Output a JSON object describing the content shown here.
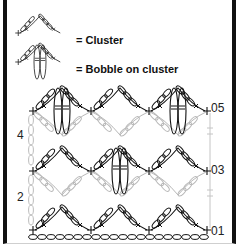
{
  "legend": {
    "cluster_label": "= Cluster",
    "bobble_label": "= Bobble on cluster"
  },
  "chart": {
    "type": "crochet-chart",
    "row_labels_left": [
      "4",
      "2"
    ],
    "row_labels_right": [
      "05",
      "03",
      "01"
    ],
    "colors": {
      "odd_rows": "#111111",
      "even_rows": "#b8b8b8",
      "frame": "#111111"
    },
    "rows": [
      {
        "row": 1,
        "label": "01",
        "motif": "cluster",
        "bobbles": 0
      },
      {
        "row": 2,
        "label": "2",
        "motif": "inverted-cluster",
        "color": "gray"
      },
      {
        "row": 3,
        "label": "03",
        "motif": "cluster",
        "bobbles": 1
      },
      {
        "row": 4,
        "label": "4",
        "motif": "inverted-cluster",
        "color": "gray"
      },
      {
        "row": 5,
        "label": "05",
        "motif": "cluster",
        "bobbles": 2
      }
    ]
  }
}
